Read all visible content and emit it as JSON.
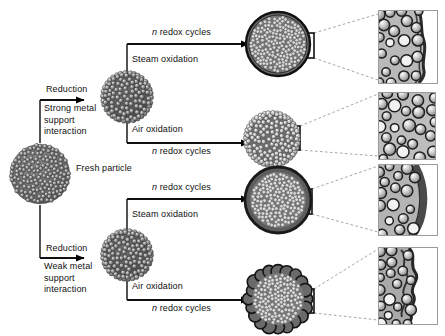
{
  "figure": {
    "type": "schematic-diagram",
    "background_color": "#ffffff",
    "line_color": "#000000",
    "guide_color": "#9a9a9a"
  },
  "start": {
    "label": "Fresh particle",
    "particle_name": "fresh-particle"
  },
  "branches": [
    {
      "id": "strong",
      "arrow_label": "Reduction",
      "sub_label": "Strong metal support interaction",
      "sub_label_lines": [
        "Strong metal",
        "support",
        "interaction"
      ],
      "particle_name": "reduced-particle-strong"
    },
    {
      "id": "weak",
      "arrow_label": "Reduction",
      "sub_label": "Weak metal support interaction",
      "sub_label_lines": [
        "Weak metal",
        "support",
        "interaction"
      ],
      "particle_name": "reduced-particle-weak"
    }
  ],
  "rows": [
    {
      "id": "row-1",
      "branch": "strong",
      "treatment": "Steam oxidation",
      "cycles_label_prefix": "n",
      "cycles_label_rest": " redox cycles",
      "cycles_position": "above",
      "result_particle": "encapsulated-particle",
      "inset_description": "Dark continuous overlayer encapsulating the metal particles"
    },
    {
      "id": "row-2",
      "branch": "strong",
      "treatment": "Air oxidation",
      "cycles_label_prefix": "n",
      "cycles_label_rest": " redox cycles",
      "cycles_position": "below",
      "result_particle": "dispersed-particle",
      "inset_description": "Separated metal particles with no overlayer"
    },
    {
      "id": "row-3",
      "branch": "weak",
      "treatment": "Steam oxidation",
      "cycles_label_prefix": "n",
      "cycles_label_rest": " redox cycles",
      "cycles_position": "above",
      "result_particle": "thick-shell-particle",
      "inset_description": "Thick smooth shell at the particle surface"
    },
    {
      "id": "row-4",
      "branch": "weak",
      "treatment": "Air oxidation",
      "cycles_label_prefix": "n",
      "cycles_label_rest": " redox cycles",
      "cycles_position": "below",
      "result_particle": "rough-shell-particle",
      "inset_description": "Rough, jagged, corrugated shell at the particle surface"
    }
  ]
}
